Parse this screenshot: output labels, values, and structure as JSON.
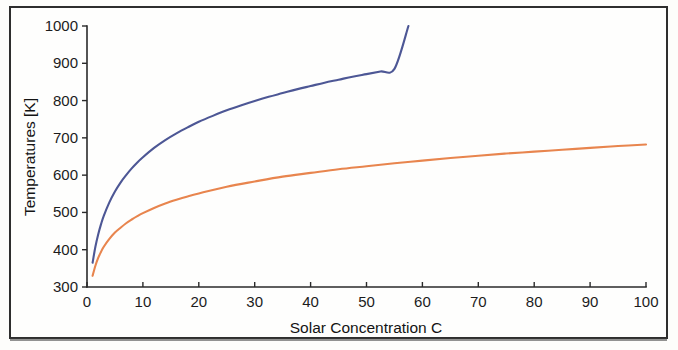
{
  "figure": {
    "background_color": "#fefefd",
    "frame_color": "#2e2e2e"
  },
  "chart_data": {
    "type": "line",
    "title": "",
    "subtitle": "",
    "xlabel": "Solar Concentration C",
    "ylabel": "Temperatures [K]",
    "xlim": [
      0,
      100
    ],
    "ylim": [
      300,
      1000
    ],
    "xticks": [
      0,
      10,
      20,
      30,
      40,
      50,
      60,
      70,
      80,
      90,
      100
    ],
    "xtick_labels": [
      "0",
      "10",
      "20",
      "30",
      "40",
      "50",
      "60",
      "70",
      "80",
      "90",
      "100"
    ],
    "yticks": [
      300,
      400,
      500,
      600,
      700,
      800,
      900,
      1000
    ],
    "ytick_labels": [
      "300",
      "400",
      "500",
      "600",
      "700",
      "800",
      "900",
      "1000"
    ],
    "grid": false,
    "legend": null,
    "legend_position": "none",
    "annotations": [],
    "series": [
      {
        "name": "upper-temperature-curve",
        "color": "#4d5795",
        "x": [
          1,
          1.5,
          2,
          2.5,
          3,
          4,
          5,
          6,
          7,
          8,
          9,
          10,
          12,
          14,
          16,
          18,
          20,
          22.5,
          25,
          27.5,
          30,
          32.5,
          35,
          37.5,
          40,
          42.5,
          45,
          47.5,
          50,
          52.5,
          55,
          57.5
        ],
        "values": [
          365,
          408,
          441,
          468,
          491,
          527,
          556,
          580,
          600,
          618,
          634,
          648,
          673,
          694,
          712,
          728,
          743,
          759,
          774,
          787,
          799,
          810,
          820,
          830,
          839,
          848,
          856,
          864,
          871,
          878,
          885,
          1000
        ]
      },
      {
        "name": "lower-temperature-curve",
        "color": "#e8854e",
        "x": [
          1,
          1.5,
          2,
          2.5,
          3,
          4,
          5,
          6,
          7,
          8,
          9,
          10,
          12,
          14,
          16,
          18,
          20,
          25,
          30,
          35,
          40,
          45,
          50,
          55,
          60,
          65,
          70,
          75,
          80,
          85,
          90,
          95,
          100
        ],
        "values": [
          330,
          357,
          378,
          394,
          408,
          429,
          446,
          459,
          471,
          481,
          490,
          498,
          512,
          524,
          534,
          543,
          551,
          569,
          583,
          596,
          606,
          616,
          624,
          632,
          639,
          646,
          652,
          658,
          663,
          668,
          673,
          678,
          682
        ]
      }
    ]
  },
  "axes": {
    "x_axis_label": "Solar Concentration C",
    "y_axis_label": "Temperatures [K]"
  }
}
